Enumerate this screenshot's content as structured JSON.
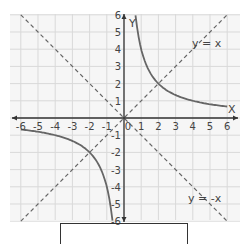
{
  "chart_data": {
    "type": "line",
    "title": "",
    "xlabel": "X",
    "ylabel": "Y",
    "xlim": [
      -6,
      6
    ],
    "ylim": [
      -6,
      6
    ],
    "grid": true,
    "x_ticks": [
      -6,
      -5,
      -4,
      -3,
      -2,
      -1,
      0,
      1,
      2,
      3,
      4,
      5,
      6
    ],
    "y_ticks": [
      -6,
      -5,
      -4,
      -3,
      -2,
      -1,
      1,
      2,
      3,
      4,
      5,
      6
    ],
    "series": [
      {
        "name": "y = 4/x",
        "style": "solid",
        "color": "#666666",
        "x": [
          0.67,
          1,
          1.5,
          2,
          3,
          4,
          5,
          6
        ],
        "y": [
          6,
          4,
          2.67,
          2,
          1.33,
          1,
          0.8,
          0.67
        ]
      },
      {
        "name": "y = 4/x (negative branch)",
        "style": "solid",
        "color": "#666666",
        "x": [
          -6,
          -5,
          -4,
          -3,
          -2,
          -1.5,
          -1,
          -0.67
        ],
        "y": [
          -0.67,
          -0.8,
          -1,
          -1.33,
          -2,
          -2.67,
          -4,
          -6
        ]
      },
      {
        "name": "y = x",
        "style": "dashed",
        "color": "#666666",
        "x": [
          -6,
          6
        ],
        "y": [
          -6,
          6
        ]
      },
      {
        "name": "y = -x",
        "style": "dashed",
        "color": "#666666",
        "x": [
          -6,
          6
        ],
        "y": [
          6,
          -6
        ]
      }
    ],
    "annotations": [
      {
        "text": "y = x",
        "x": 4.8,
        "y": 4.7
      },
      {
        "text": "y = -x",
        "x": 4.8,
        "y": -4.6
      }
    ]
  },
  "labels": {
    "x_axis": "X",
    "y_axis": "Y",
    "line1": "y = x",
    "line2": "y = -x"
  }
}
